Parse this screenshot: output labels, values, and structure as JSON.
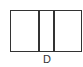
{
  "diagram": {
    "type": "rectangle-divided-into-three-cells",
    "cells": 3,
    "label": "D",
    "stroke_color": "#333333",
    "background": "#ffffff"
  }
}
